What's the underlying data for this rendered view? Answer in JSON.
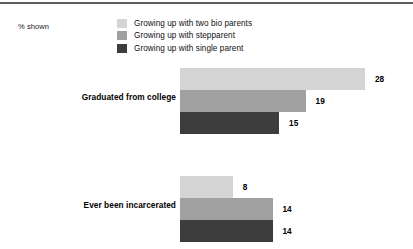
{
  "chart_data": {
    "type": "bar",
    "orientation": "horizontal",
    "title": "",
    "subtitle": "",
    "xlabel": "",
    "ylabel": "",
    "units_note": "% shown",
    "grid": false,
    "legend_position": "top",
    "xlim": [
      0,
      28
    ],
    "categories": [
      "Graduated from college",
      "Ever been incarcerated"
    ],
    "series": [
      {
        "name": "Growing up with two bio parents",
        "color": "#d4d4d4",
        "values": [
          28,
          8
        ]
      },
      {
        "name": "Growing up with stepparent",
        "color": "#a0a0a0",
        "values": [
          19,
          14
        ]
      },
      {
        "name": "Growing up with single parent",
        "color": "#3d3d3d",
        "values": [
          15,
          14
        ]
      }
    ]
  },
  "header": {
    "units_label": "% shown"
  },
  "legend": {
    "items": [
      {
        "label": "Growing up with two bio parents",
        "color": "#d4d4d4"
      },
      {
        "label": "Growing up with stepparent",
        "color": "#a0a0a0"
      },
      {
        "label": "Growing up with single parent",
        "color": "#3d3d3d"
      }
    ]
  },
  "groups": [
    {
      "label": "Graduated from college",
      "bars": [
        {
          "series": "Growing up with two bio parents",
          "value": 28,
          "value_text": "28",
          "color": "#d4d4d4"
        },
        {
          "series": "Growing up with stepparent",
          "value": 19,
          "value_text": "19",
          "color": "#a0a0a0"
        },
        {
          "series": "Growing up with single parent",
          "value": 15,
          "value_text": "15",
          "color": "#3d3d3d"
        }
      ]
    },
    {
      "label": "Ever been incarcerated",
      "bars": [
        {
          "series": "Growing up with two bio parents",
          "value": 8,
          "value_text": "8",
          "color": "#d4d4d4"
        },
        {
          "series": "Growing up with stepparent",
          "value": 14,
          "value_text": "14",
          "color": "#a0a0a0"
        },
        {
          "series": "Growing up with single parent",
          "value": 14,
          "value_text": "14",
          "color": "#3d3d3d"
        }
      ]
    }
  ],
  "style": {
    "background": "#ffffff",
    "rule_color": "#5a5f63",
    "text_color": "#111111"
  }
}
